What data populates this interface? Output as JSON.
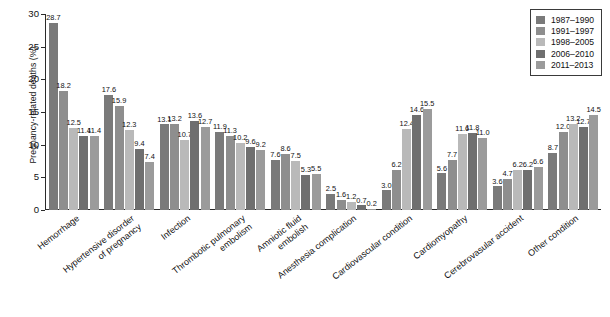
{
  "chart_data": {
    "type": "bar",
    "title": "",
    "xlabel": "",
    "ylabel": "Pregnancy-related deaths (%)",
    "ylim": [
      0,
      30
    ],
    "yticks": [
      0,
      5,
      10,
      15,
      20,
      25,
      30
    ],
    "grid": false,
    "legend_position": "top-right",
    "categories": [
      "Hemorrhage",
      "Hypertensive disorder\nof pregnancy",
      "Infection",
      "Thrombotic pulmonary\nembolism",
      "Amniotic fluid\nembolish",
      "Anesthesia complication",
      "Cardiovascular condition",
      "Cardiomyopathy",
      "Cerebrovasular accident",
      "Other condition"
    ],
    "series": [
      {
        "name": "1987–1990",
        "color": "#7a7a7a",
        "values": [
          28.7,
          17.6,
          13.1,
          11.9,
          7.6,
          2.5,
          3.0,
          5.6,
          3.6,
          8.7
        ]
      },
      {
        "name": "1991–1997",
        "color": "#8e8e8e",
        "values": [
          18.2,
          15.9,
          13.2,
          11.3,
          8.6,
          1.6,
          6.2,
          7.7,
          4.7,
          12.0
        ]
      },
      {
        "name": "1998–2005",
        "color": "#b9b9b9",
        "values": [
          12.5,
          12.3,
          10.7,
          10.2,
          7.5,
          1.2,
          12.4,
          11.6,
          6.2,
          13.2
        ]
      },
      {
        "name": "2006–2010",
        "color": "#6f6f6f",
        "values": [
          11.4,
          9.4,
          13.6,
          9.6,
          5.3,
          0.7,
          14.6,
          11.8,
          6.2,
          12.7
        ]
      },
      {
        "name": "2011–2013",
        "color": "#9b9b9b",
        "values": [
          11.4,
          7.4,
          12.7,
          9.2,
          5.5,
          0.2,
          15.5,
          11.0,
          6.6,
          14.5
        ]
      }
    ]
  }
}
